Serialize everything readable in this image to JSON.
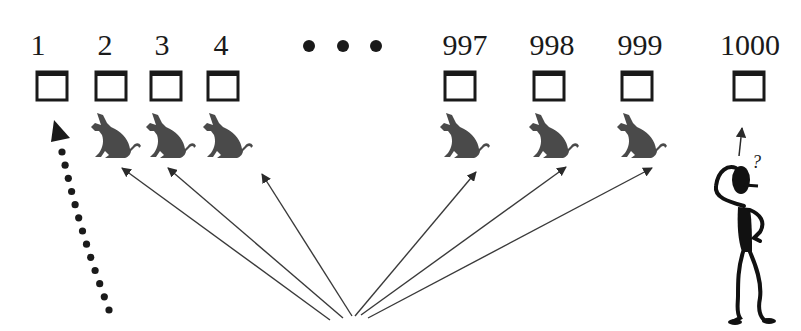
{
  "diagram": {
    "type": "doors-problem",
    "colors": {
      "ink": "#1a1a1a",
      "donkey": "#4a4a4a",
      "arrow": "#3a3a3a",
      "background": "#ffffff"
    },
    "ellipsis": "• • •",
    "doors": [
      {
        "label": "1",
        "content": "empty",
        "marker": "dotted-arrow"
      },
      {
        "label": "2",
        "content": "donkey"
      },
      {
        "label": "3",
        "content": "donkey"
      },
      {
        "label": "4",
        "content": "donkey"
      },
      {
        "label": "997",
        "content": "donkey"
      },
      {
        "label": "998",
        "content": "donkey"
      },
      {
        "label": "999",
        "content": "donkey"
      },
      {
        "label": "1000",
        "content": "empty",
        "marker": "person-arrow"
      }
    ],
    "person": {
      "thought": "?"
    }
  }
}
